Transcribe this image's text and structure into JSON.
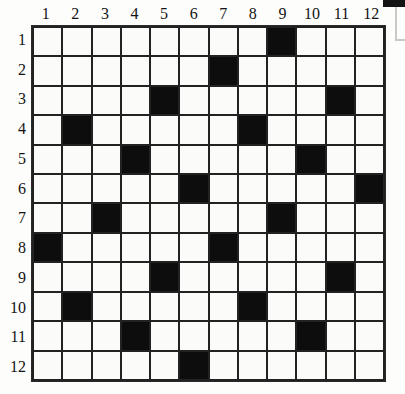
{
  "grid": {
    "title": "12x12 black-and-white cell grid",
    "rows": 12,
    "columns": 12,
    "column_labels": [
      "1",
      "2",
      "3",
      "4",
      "5",
      "6",
      "7",
      "8",
      "9",
      "10",
      "11",
      "12"
    ],
    "row_labels": [
      "1",
      "2",
      "3",
      "4",
      "5",
      "6",
      "7",
      "8",
      "9",
      "10",
      "11",
      "12"
    ],
    "colors": {
      "filled": "#0d0d0d",
      "empty": "#fbfbfa",
      "line": "#222222",
      "label": "#131313",
      "page": "#fdfdfc"
    },
    "filled_cells_by_row": [
      [
        9
      ],
      [
        7
      ],
      [
        5,
        11
      ],
      [
        2,
        8
      ],
      [
        4,
        10
      ],
      [
        6,
        12
      ],
      [
        3,
        9
      ],
      [
        1,
        7
      ],
      [
        5,
        11
      ],
      [
        2,
        8
      ],
      [
        4,
        10
      ],
      [
        6
      ]
    ],
    "filled_count": 23
  },
  "artifacts": {
    "top_right_mark": "scan-artifact"
  }
}
